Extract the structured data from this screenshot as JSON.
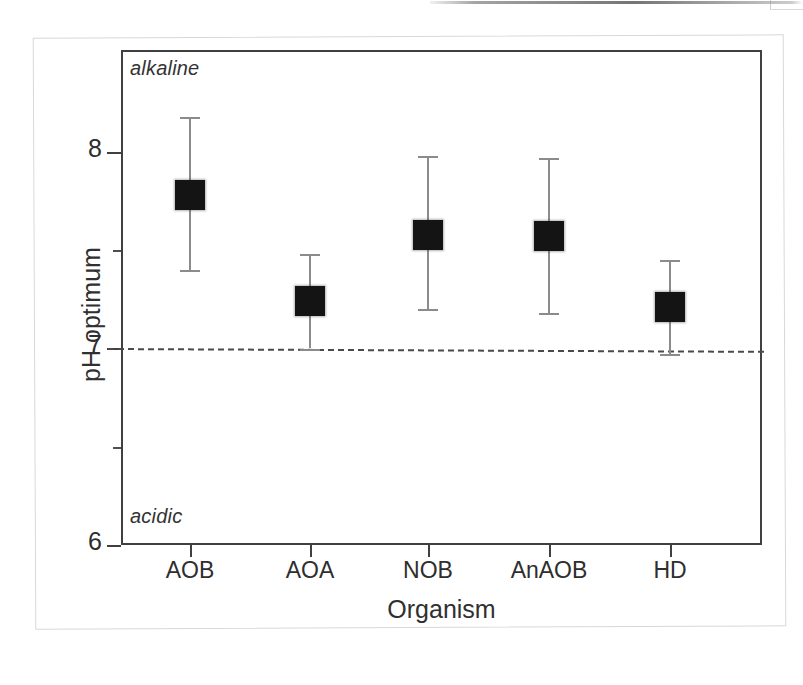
{
  "chart_data": {
    "type": "scatter",
    "title": "",
    "subtitle": "",
    "xlabel": "Organism",
    "ylabel": "pH optimum",
    "categories": [
      "AOB",
      "AOA",
      "NOB",
      "AnAOB",
      "HD"
    ],
    "values": [
      7.78,
      7.24,
      7.58,
      7.57,
      7.21
    ],
    "error_low": [
      7.4,
      7.0,
      7.2,
      7.18,
      6.97
    ],
    "error_high": [
      8.18,
      7.48,
      7.98,
      7.97,
      7.45
    ],
    "ylim": [
      6,
      8.5
    ],
    "yticks": [
      6,
      7,
      8
    ],
    "ytick_labels": [
      "6",
      "7",
      "8"
    ],
    "yminor_ticks": [
      6.5,
      7.5
    ],
    "grid": false,
    "legend": null,
    "reference_line": {
      "value": 7,
      "style": "dashed",
      "label": ""
    },
    "annotations": [
      {
        "text": "alkaline",
        "position": "top-left",
        "style": "italic"
      },
      {
        "text": "acidic",
        "position": "bottom-left",
        "style": "italic"
      }
    ],
    "series": [
      {
        "name": "pH optimum",
        "marker": "filled-square",
        "color": "#141414",
        "errorbar_color": "#8b8b8b",
        "points": [
          {
            "category": "AOB",
            "value": 7.78,
            "low": 7.4,
            "high": 8.18
          },
          {
            "category": "AOA",
            "value": 7.24,
            "low": 7.0,
            "high": 7.48
          },
          {
            "category": "NOB",
            "value": 7.58,
            "low": 7.2,
            "high": 7.98
          },
          {
            "category": "AnAOB",
            "value": 7.57,
            "low": 7.18,
            "high": 7.97
          },
          {
            "category": "HD",
            "value": 7.21,
            "low": 6.97,
            "high": 7.45
          }
        ]
      }
    ]
  },
  "axis": {
    "y_title": "pH optimum",
    "x_title": "Organism",
    "y_tick_labels": [
      "8",
      "7",
      "6"
    ],
    "x_tick_labels": [
      "AOB",
      "AOA",
      "NOB",
      "AnAOB",
      "HD"
    ]
  },
  "annotations": {
    "alkaline": "alkaline",
    "acidic": "acidic"
  },
  "colors": {
    "marker": "#141414",
    "errorbar": "#8b8b8b",
    "axis": "#404040",
    "reference_line": "#4a4a4a",
    "figure_frame": "#d8d8d8",
    "background": "#ffffff"
  }
}
